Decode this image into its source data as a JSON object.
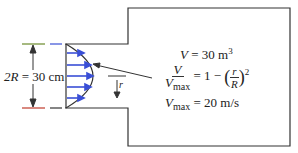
{
  "diagram": {
    "type": "pipe-flow-into-tank",
    "diameter_label": {
      "lhs": "2R",
      "eq": "=",
      "value": "30 cm"
    },
    "volume": {
      "symbol": "V",
      "eq": "=",
      "value": "30 m",
      "exp": "3"
    },
    "profile": {
      "lhs_num": "V",
      "lhs_den": "V",
      "lhs_den_sub": "max",
      "rhs_prefix": "= 1 −",
      "ratio_num": "r",
      "ratio_den": "R",
      "exp": "2"
    },
    "vmax": {
      "symbol": "V",
      "sub": "max",
      "eq": "=",
      "value": "20 m/s"
    },
    "radius_marker": "r",
    "colors": {
      "outline": "#333333",
      "arrows": "#3a4fd6",
      "tick_top_left": "#6a8a2a",
      "tick_top_right": "#3a4fd6",
      "tick_bottom_left": "#c0392b"
    }
  }
}
